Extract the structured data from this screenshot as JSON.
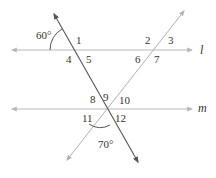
{
  "diagram": {
    "lines": [
      {
        "name": "l",
        "label": "l",
        "x1": 12,
        "y1": 50,
        "x2": 192,
        "y2": 50,
        "color": "#b8b8b8"
      },
      {
        "name": "m",
        "label": "m",
        "x1": 12,
        "y1": 109,
        "x2": 192,
        "y2": 109,
        "color": "#b8b8b8"
      }
    ],
    "transversals": [
      {
        "name": "transversal-steep",
        "x1": 54,
        "y1": 14,
        "x2": 138,
        "y2": 162,
        "color": "#555555"
      },
      {
        "name": "transversal-rising",
        "x1": 184,
        "y1": 11,
        "x2": 67,
        "y2": 160,
        "color": "#b0b0b0"
      }
    ],
    "angle_labels": [
      {
        "num": "1",
        "x": 76,
        "y": 44
      },
      {
        "num": "2",
        "x": 145,
        "y": 44
      },
      {
        "num": "3",
        "x": 168,
        "y": 44
      },
      {
        "num": "4",
        "x": 66,
        "y": 63
      },
      {
        "num": "5",
        "x": 86,
        "y": 63
      },
      {
        "num": "6",
        "x": 135,
        "y": 63
      },
      {
        "num": "7",
        "x": 154,
        "y": 63
      },
      {
        "num": "8",
        "x": 90,
        "y": 103
      },
      {
        "num": "9",
        "x": 103,
        "y": 101
      },
      {
        "num": "10",
        "x": 119,
        "y": 104
      },
      {
        "num": "11",
        "x": 82,
        "y": 122
      },
      {
        "num": "12",
        "x": 115,
        "y": 122
      }
    ],
    "angle_measures": [
      {
        "text": "60°",
        "x": 36,
        "y": 39
      },
      {
        "text": "70°",
        "x": 98,
        "y": 148
      }
    ],
    "line_labels": {
      "l": {
        "text": "l",
        "x": 200,
        "y": 54
      },
      "m": {
        "text": "m",
        "x": 198,
        "y": 112
      }
    }
  }
}
